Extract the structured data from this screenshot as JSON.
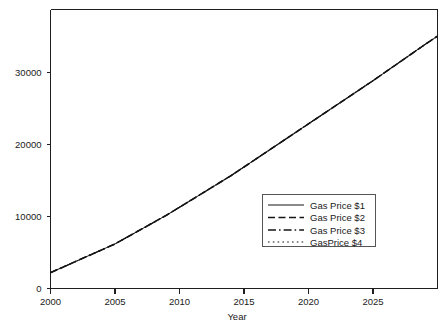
{
  "chart_data": {
    "type": "line",
    "title": "",
    "subtitle": "",
    "xlabel": "Year",
    "ylabel": "",
    "xlim": [
      2000,
      2030
    ],
    "ylim": [
      0,
      38800
    ],
    "grid": false,
    "legend_position": "center-right",
    "x_ticks": [
      2000,
      2005,
      2010,
      2015,
      2020,
      2025
    ],
    "x_tick_labels": [
      "2000",
      "2005",
      "2010",
      "2015",
      "2020",
      "2025"
    ],
    "y_ticks": [
      0,
      10000,
      20000,
      30000
    ],
    "y_tick_labels": [
      "0",
      "10000",
      "20000",
      "30000"
    ],
    "x": [
      2000,
      2001,
      2002,
      2003,
      2004,
      2005,
      2006,
      2007,
      2008,
      2009,
      2010,
      2011,
      2012,
      2013,
      2014,
      2015,
      2016,
      2017,
      2018,
      2019,
      2020,
      2021,
      2022,
      2023,
      2024,
      2025,
      2026,
      2027,
      2028,
      2029,
      2030
    ],
    "series": [
      {
        "name": "Gas Price $1",
        "dash": "solid",
        "color": "#151515",
        "width": 1.0,
        "values": [
          2200,
          3000,
          3800,
          4600,
          5400,
          6200,
          7200,
          8200,
          9200,
          10200,
          11300,
          12400,
          13500,
          14600,
          15700,
          16900,
          18100,
          19300,
          20500,
          21700,
          22900,
          24100,
          25300,
          26500,
          27700,
          28900,
          30150,
          31400,
          32650,
          33900,
          35100
        ]
      },
      {
        "name": "Gas Price $2",
        "dash": "dashed",
        "color": "#151515",
        "width": 1.6,
        "values": [
          2200,
          3000,
          3800,
          4600,
          5400,
          6200,
          7200,
          8200,
          9200,
          10200,
          11300,
          12400,
          13500,
          14600,
          15700,
          16900,
          18100,
          19300,
          20500,
          21700,
          22900,
          24100,
          25300,
          26500,
          27700,
          28900,
          30150,
          31400,
          32650,
          33900,
          35100
        ]
      },
      {
        "name": "Gas Price $3",
        "dash": "dashdot",
        "color": "#151515",
        "width": 1.3,
        "values": [
          2200,
          3000,
          3800,
          4600,
          5400,
          6200,
          7200,
          8200,
          9200,
          10200,
          11300,
          12400,
          13500,
          14600,
          15700,
          16900,
          18100,
          19300,
          20500,
          21700,
          22900,
          24100,
          25300,
          26500,
          27700,
          28900,
          30150,
          31400,
          32650,
          33900,
          35100
        ]
      },
      {
        "name": "GasPrice $4",
        "dash": "dotted",
        "color": "#151515",
        "width": 1.1,
        "values": [
          2200,
          3000,
          3800,
          4600,
          5400,
          6200,
          7200,
          8200,
          9200,
          10200,
          11300,
          12400,
          13500,
          14600,
          15700,
          16900,
          18100,
          19300,
          20500,
          21700,
          22900,
          24100,
          25300,
          26500,
          27700,
          28900,
          30150,
          31400,
          32650,
          33900,
          35100
        ]
      }
    ],
    "legend_entries": [
      {
        "label": "Gas Price $1",
        "dash": "solid"
      },
      {
        "label": "Gas Price $2",
        "dash": "dashed"
      },
      {
        "label": "Gas Price $3",
        "dash": "dashdot"
      },
      {
        "label": "GasPrice $4",
        "dash": "dotted"
      }
    ]
  },
  "figure": {
    "background_color": "#ffffff",
    "axis_color": "#1f1f1f",
    "text_color": "#1a1a1a",
    "legend_border_color": "#555555"
  }
}
